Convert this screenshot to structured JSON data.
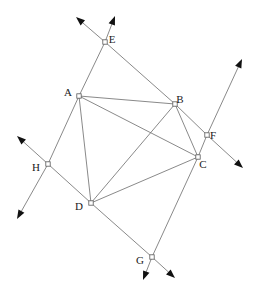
{
  "figure": {
    "type": "line-diagram",
    "canvas": {
      "width": 264,
      "height": 295
    },
    "stroke_color": "#6b6b6b",
    "arrow_color": "#111111",
    "label_color": "#1a1a1a",
    "background": "#ffffff"
  },
  "points": [
    {
      "id": "A",
      "label": "A",
      "x": 79,
      "y": 96,
      "label_x": 68,
      "label_y": 93
    },
    {
      "id": "B",
      "label": "B",
      "x": 175,
      "y": 104,
      "label_x": 180,
      "label_y": 100
    },
    {
      "id": "C",
      "label": "C",
      "x": 198,
      "y": 157,
      "label_x": 203,
      "label_y": 165
    },
    {
      "id": "D",
      "label": "D",
      "x": 91,
      "y": 203,
      "label_x": 79,
      "label_y": 207
    },
    {
      "id": "E",
      "label": "E",
      "x": 105,
      "y": 42,
      "label_x": 112,
      "label_y": 40
    },
    {
      "id": "F",
      "label": "F",
      "x": 207,
      "y": 135,
      "label_x": 213,
      "label_y": 136
    },
    {
      "id": "G",
      "label": "G",
      "x": 152,
      "y": 257,
      "label_x": 140,
      "label_y": 261
    },
    {
      "id": "H",
      "label": "H",
      "x": 48,
      "y": 164,
      "label_x": 36,
      "label_y": 168
    }
  ],
  "segments": [
    {
      "name": "A-B",
      "from": "A",
      "to": "B"
    },
    {
      "name": "B-C",
      "from": "B",
      "to": "C"
    },
    {
      "name": "C-D",
      "from": "C",
      "to": "D"
    },
    {
      "name": "D-A",
      "from": "D",
      "to": "A"
    },
    {
      "name": "A-C",
      "from": "A",
      "to": "C"
    },
    {
      "name": "B-D",
      "from": "B",
      "to": "D"
    },
    {
      "name": "A-E",
      "from": "A",
      "to": "E"
    },
    {
      "name": "E-B",
      "from": "E",
      "to": "B"
    },
    {
      "name": "B-F",
      "from": "B",
      "to": "F"
    },
    {
      "name": "F-C",
      "from": "F",
      "to": "C"
    },
    {
      "name": "C-G",
      "from": "C",
      "to": "G"
    },
    {
      "name": "G-D",
      "from": "G",
      "to": "D"
    },
    {
      "name": "D-H",
      "from": "D",
      "to": "H"
    },
    {
      "name": "H-A",
      "from": "H",
      "to": "A"
    }
  ],
  "rays": [
    {
      "name": "ray-E-upleft",
      "from": "E",
      "tip_x": 76,
      "tip_y": 17
    },
    {
      "name": "ray-E-upright",
      "from": "E",
      "tip_x": 115,
      "tip_y": 16
    },
    {
      "name": "ray-F-upright",
      "from": "F",
      "tip_x": 242,
      "tip_y": 59
    },
    {
      "name": "ray-F-downright",
      "from": "F",
      "tip_x": 243,
      "tip_y": 168
    },
    {
      "name": "ray-H-upleft",
      "from": "H",
      "tip_x": 17,
      "tip_y": 136
    },
    {
      "name": "ray-H-downleft",
      "from": "H",
      "tip_x": 17,
      "tip_y": 219
    },
    {
      "name": "ray-G-downleft",
      "from": "G",
      "tip_x": 143,
      "tip_y": 280
    },
    {
      "name": "ray-G-downright",
      "from": "G",
      "tip_x": 175,
      "tip_y": 278
    }
  ],
  "chart_data": {
    "type": "scatter",
    "xlabel": "",
    "ylabel": "",
    "xlim": [
      0,
      264
    ],
    "ylim": [
      0,
      295
    ],
    "grid": false,
    "legend": "none",
    "labels": [
      "A",
      "B",
      "C",
      "D",
      "E",
      "F",
      "G",
      "H"
    ],
    "x": [
      79,
      175,
      198,
      91,
      105,
      207,
      152,
      48
    ],
    "y": [
      96,
      104,
      157,
      203,
      42,
      135,
      257,
      164
    ],
    "annotations": [
      "Quadrilateral ABCD drawn with both diagonals AC and BD",
      "Line through A, E continues as ray beyond E",
      "Line through E, B, F continues as ray beyond F",
      "Line through F, C continues as ray beyond F",
      "Line through D, H continues as rays beyond H",
      "Line through C, G and D, G continue as rays beyond G"
    ]
  }
}
